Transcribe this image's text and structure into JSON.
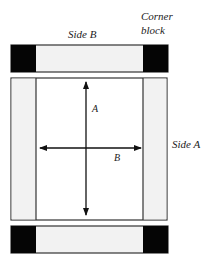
{
  "labels": {
    "side_b": "Side B",
    "corner_line1": "Corner",
    "corner_line2": "block",
    "side_a": "Side A",
    "arrow_a": "A",
    "arrow_b": "B"
  },
  "colors": {
    "corner_block": "#050505",
    "side_fill": "#f2f2f2",
    "center_fill": "#ffffff",
    "stroke": "#333333"
  }
}
